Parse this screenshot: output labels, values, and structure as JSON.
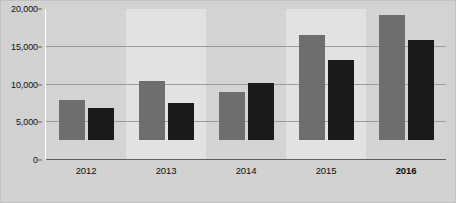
{
  "chart_data": {
    "type": "bar",
    "title": "",
    "subtitle": "",
    "xlabel": "",
    "ylabel": "",
    "categories": [
      "2012",
      "2013",
      "2014",
      "2015",
      "2016"
    ],
    "series": [
      {
        "name": "series-a",
        "color": "#6e6e6e",
        "values": [
          6124,
          9010,
          7372,
          15973,
          19139
        ],
        "labels": [
          "6,124",
          "9,010",
          "7,372",
          "15,973",
          "19,139"
        ]
      },
      {
        "name": "series-b",
        "color": "#1a1a1a",
        "values": [
          4891,
          5623,
          8691,
          12205,
          15231
        ],
        "labels": [
          "4,891",
          "5,623",
          "8,691",
          "12,205",
          "15,231"
        ]
      }
    ],
    "ylim": [
      0,
      20000
    ],
    "yticks": [
      0,
      5000,
      10000,
      15000,
      20000
    ],
    "ytick_labels": [
      "0",
      "5,000",
      "10,000",
      "15,000",
      "20,000"
    ],
    "grid": true,
    "grid_axis": "y",
    "legend": false,
    "legend_position": "none",
    "emphasized_category": "2016",
    "annotations": [],
    "colors": {
      "series_a": "#6e6e6e",
      "series_b": "#1a1a1a",
      "plot_background": "#d8d8d8",
      "band_light": "#e2e2e2",
      "band_dark": "#d4d4d4",
      "frame_background": "#d2d2d2",
      "gridline": "#9b9b9b",
      "axis_line": "#5d5d5d",
      "text": "#0e0e0e"
    }
  }
}
